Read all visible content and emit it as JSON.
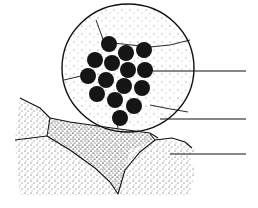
{
  "diagram": {
    "type": "biological-illustration",
    "colors": {
      "background": "#ffffff",
      "ink": "#111111",
      "stipple": "#333333"
    },
    "cell": {
      "cx": 128,
      "cy": 68,
      "rx": 66,
      "ry": 64
    },
    "spheres": [
      {
        "cx": 109,
        "cy": 44,
        "r": 8
      },
      {
        "cx": 126,
        "cy": 53,
        "r": 8
      },
      {
        "cx": 144,
        "cy": 50,
        "r": 8
      },
      {
        "cx": 95,
        "cy": 60,
        "r": 8
      },
      {
        "cx": 112,
        "cy": 63,
        "r": 8
      },
      {
        "cx": 128,
        "cy": 70,
        "r": 8
      },
      {
        "cx": 145,
        "cy": 70,
        "r": 8
      },
      {
        "cx": 88,
        "cy": 76,
        "r": 8
      },
      {
        "cx": 106,
        "cy": 80,
        "r": 8
      },
      {
        "cx": 124,
        "cy": 86,
        "r": 8
      },
      {
        "cx": 142,
        "cy": 88,
        "r": 8
      },
      {
        "cx": 97,
        "cy": 94,
        "r": 8
      },
      {
        "cx": 115,
        "cy": 100,
        "r": 8
      },
      {
        "cx": 134,
        "cy": 106,
        "r": 8
      },
      {
        "cx": 120,
        "cy": 118,
        "r": 8
      }
    ],
    "leader_lines": [
      {
        "x1": 150,
        "y1": 71,
        "x2": 246,
        "y2": 71
      },
      {
        "x1": 160,
        "y1": 119,
        "x2": 246,
        "y2": 119
      },
      {
        "x1": 170,
        "y1": 154,
        "x2": 246,
        "y2": 154
      }
    ],
    "labels": []
  }
}
